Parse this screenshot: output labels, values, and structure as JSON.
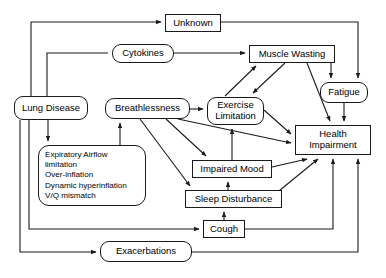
{
  "diagram": {
    "type": "flowchart",
    "title": "",
    "style": {
      "line_color": "#1a1a1a",
      "box_fill": "#ffffff",
      "text_color": "#000000",
      "background": "#ffffff"
    },
    "nodes": [
      {
        "id": "unknown",
        "label": "Unknown",
        "shape": "rectangle"
      },
      {
        "id": "cytokines",
        "label": "Cytokines",
        "shape": "rounded-rectangle"
      },
      {
        "id": "muscle_wasting",
        "label": "Muscle Wasting",
        "shape": "rectangle"
      },
      {
        "id": "fatigue",
        "label": "Fatigue",
        "shape": "rounded-rectangle"
      },
      {
        "id": "lung_disease",
        "label": "Lung Disease",
        "shape": "rounded-rectangle"
      },
      {
        "id": "breathlessness",
        "label": "Breathlessness",
        "shape": "rounded-rectangle"
      },
      {
        "id": "exercise_limitation",
        "label_line1": "Exercise",
        "label_line2": "Limitation",
        "shape": "rounded-rectangle"
      },
      {
        "id": "health_impairment",
        "label_line1": "Health",
        "label_line2": "Impairment",
        "shape": "rectangle"
      },
      {
        "id": "impaired_mood",
        "label": "Impaired Mood",
        "shape": "rectangle"
      },
      {
        "id": "sleep_disturbance",
        "label": "Sleep Disturbance",
        "shape": "rectangle"
      },
      {
        "id": "cough",
        "label": "Cough",
        "shape": "rectangle"
      },
      {
        "id": "exacerbations",
        "label": "Exacerbations",
        "shape": "rounded-rectangle"
      },
      {
        "id": "lung_detail",
        "shape": "rounded-rectangle",
        "lines": [
          "Expiratory Airflow",
          "limitation",
          "Over-inflation",
          "Dynamic hyperinflation",
          "V/Q mismatch"
        ]
      }
    ],
    "edges": [
      {
        "from": "lung_disease",
        "to": "unknown"
      },
      {
        "from": "unknown",
        "to": "fatigue"
      },
      {
        "from": "lung_disease",
        "to": "cytokines"
      },
      {
        "from": "cytokines",
        "to": "muscle_wasting"
      },
      {
        "from": "muscle_wasting",
        "to": "fatigue"
      },
      {
        "from": "muscle_wasting",
        "to": "exercise_limitation"
      },
      {
        "from": "exercise_limitation",
        "to": "muscle_wasting"
      },
      {
        "from": "muscle_wasting",
        "to": "health_impairment"
      },
      {
        "from": "fatigue",
        "to": "health_impairment"
      },
      {
        "from": "lung_disease",
        "to": "lung_detail"
      },
      {
        "from": "lung_disease",
        "to": "cough"
      },
      {
        "from": "lung_disease",
        "to": "exacerbations"
      },
      {
        "from": "breathlessness",
        "to": "exercise_limitation"
      },
      {
        "from": "breathlessness",
        "to": "health_impairment"
      },
      {
        "from": "breathlessness",
        "to": "impaired_mood"
      },
      {
        "from": "breathlessness",
        "to": "sleep_disturbance"
      },
      {
        "from": "sleep_disturbance",
        "to": "breathlessness"
      },
      {
        "from": "exercise_limitation",
        "to": "health_impairment"
      },
      {
        "from": "impaired_mood",
        "to": "exercise_limitation"
      },
      {
        "from": "impaired_mood",
        "to": "health_impairment"
      },
      {
        "from": "sleep_disturbance",
        "to": "impaired_mood"
      },
      {
        "from": "sleep_disturbance",
        "to": "health_impairment"
      },
      {
        "from": "cough",
        "to": "sleep_disturbance"
      },
      {
        "from": "cough",
        "to": "health_impairment"
      },
      {
        "from": "exacerbations",
        "to": "health_impairment"
      }
    ]
  }
}
